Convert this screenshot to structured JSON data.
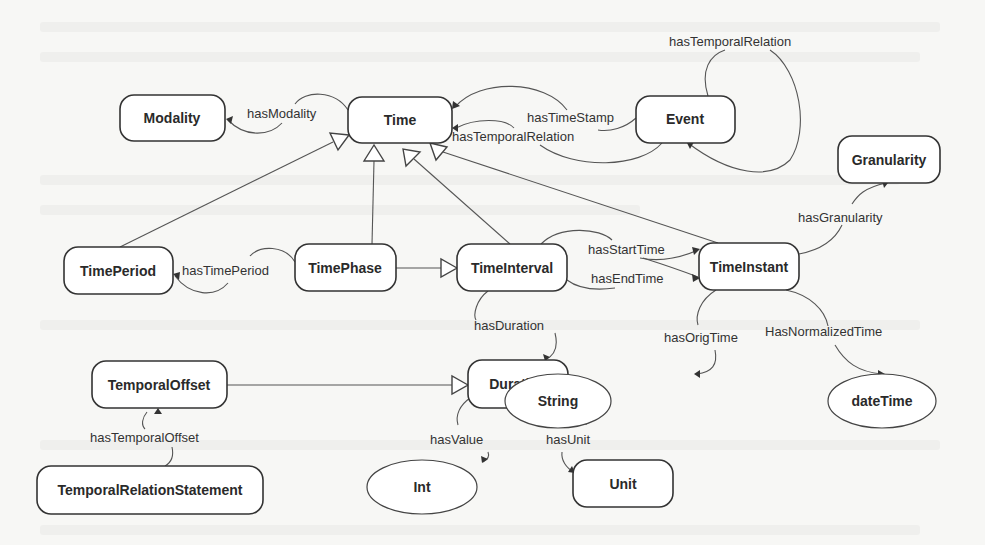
{
  "diagram": {
    "type": "ontology-class-diagram",
    "nodes": {
      "modality": "Modality",
      "time": "Time",
      "event": "Event",
      "granularity": "Granularity",
      "time_period": "TimePeriod",
      "time_phase": "TimePhase",
      "time_interval": "TimeInterval",
      "time_instant": "TimeInstant",
      "temporal_offset": "TemporalOffset",
      "duration": "Duration",
      "string": "String",
      "date_time": "dateTime",
      "temporal_relation_statement": "TemporalRelationStatement",
      "int": "Int",
      "unit": "Unit"
    },
    "edge_labels": {
      "has_modality": "hasModality",
      "has_time_stamp": "hasTimeStamp",
      "has_temporal_relation_time": "hasTemporalRelation",
      "has_temporal_relation_event": "hasTemporalRelation",
      "has_granularity": "hasGranularity",
      "has_time_period": "hasTimePeriod",
      "has_start_time": "hasStartTime",
      "has_end_time": "hasEndTime",
      "has_duration": "hasDuration",
      "has_orig_time": "hasOrigTime",
      "has_normalized_time": "HasNormalizedTime",
      "has_temporal_offset": "hasTemporalOffset",
      "has_value": "hasValue",
      "has_unit": "hasUnit"
    },
    "relations": [
      {
        "from": "Time",
        "label": "hasModality",
        "to": "Modality",
        "kind": "property"
      },
      {
        "from": "Event",
        "label": "hasTimeStamp",
        "to": "Time",
        "kind": "property"
      },
      {
        "from": "Event",
        "label": "hasTemporalRelation",
        "to": "Time",
        "kind": "property"
      },
      {
        "from": "Event",
        "label": "hasTemporalRelation",
        "to": "Event",
        "kind": "property"
      },
      {
        "from": "TimeInstant",
        "label": "hasGranularity",
        "to": "Granularity",
        "kind": "property"
      },
      {
        "from": "TimePhase",
        "label": "hasTimePeriod",
        "to": "TimePeriod",
        "kind": "property"
      },
      {
        "from": "TimeInterval",
        "label": "hasStartTime",
        "to": "TimeInstant",
        "kind": "property"
      },
      {
        "from": "TimeInterval",
        "label": "hasEndTime",
        "to": "TimeInstant",
        "kind": "property"
      },
      {
        "from": "TimeInterval",
        "label": "hasDuration",
        "to": "Duration",
        "kind": "property"
      },
      {
        "from": "TimeInstant",
        "label": "hasOrigTime",
        "to": "String",
        "kind": "property"
      },
      {
        "from": "TimeInstant",
        "label": "HasNormalizedTime",
        "to": "dateTime",
        "kind": "property"
      },
      {
        "from": "TemporalRelationStatement",
        "label": "hasTemporalOffset",
        "to": "TemporalOffset",
        "kind": "property"
      },
      {
        "from": "Duration",
        "label": "hasValue",
        "to": "Int",
        "kind": "property"
      },
      {
        "from": "Duration",
        "label": "hasUnit",
        "to": "Unit",
        "kind": "property"
      },
      {
        "from": "TimePeriod",
        "to": "Time",
        "kind": "subclass"
      },
      {
        "from": "TimePhase",
        "to": "Time",
        "kind": "subclass"
      },
      {
        "from": "TimeInterval",
        "to": "Time",
        "kind": "subclass"
      },
      {
        "from": "TimeInstant",
        "to": "Time",
        "kind": "subclass"
      },
      {
        "from": "TimePhase",
        "to": "TimeInterval",
        "kind": "subclass"
      },
      {
        "from": "TemporalOffset",
        "to": "Duration",
        "kind": "subclass"
      }
    ]
  },
  "colors": {
    "background": "#f7f7f5",
    "node_fill": "#ffffff",
    "stroke": "#333333",
    "text": "#2a2a2a"
  }
}
